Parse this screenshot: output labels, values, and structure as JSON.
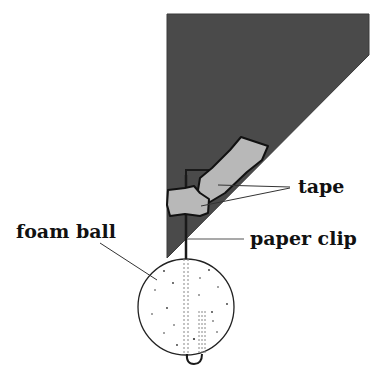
{
  "diagram": {
    "labels": {
      "tape": "tape",
      "paper_clip": "paper clip",
      "foam_ball": "foam ball"
    },
    "colors": {
      "paper": "#4a4a4a",
      "tape": "#b8b8b8",
      "outline": "#111111",
      "background": "#ffffff",
      "leader": "#333333"
    }
  }
}
